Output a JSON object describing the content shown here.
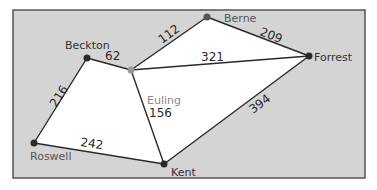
{
  "diagram": {
    "type": "weighted-graph",
    "colors": {
      "frame_fill": "#d4d4d4",
      "frame_stroke": "#555555",
      "inner_fill": "#ffffff",
      "edge": "#2a2a2a",
      "node": "#2a2a2a",
      "node_euling": "#999999",
      "label_dark": "#333333",
      "label_gray": "#8a8a8a"
    },
    "nodes": [
      {
        "id": "beckton",
        "label": "Beckton",
        "x": 87,
        "y": 58
      },
      {
        "id": "euling",
        "label": "Euling",
        "x": 131,
        "y": 70
      },
      {
        "id": "berne",
        "label": "Berne",
        "x": 207,
        "y": 17
      },
      {
        "id": "forrest",
        "label": "Forrest",
        "x": 309,
        "y": 56
      },
      {
        "id": "kent",
        "label": "Kent",
        "x": 164,
        "y": 164
      },
      {
        "id": "roswell",
        "label": "Roswell",
        "x": 34,
        "y": 143
      }
    ],
    "edges": [
      {
        "from": "beckton",
        "to": "euling",
        "weight": "62"
      },
      {
        "from": "euling",
        "to": "berne",
        "weight": "112"
      },
      {
        "from": "berne",
        "to": "forrest",
        "weight": "209"
      },
      {
        "from": "euling",
        "to": "forrest",
        "weight": "321"
      },
      {
        "from": "beckton",
        "to": "roswell",
        "weight": "216"
      },
      {
        "from": "euling",
        "to": "kent",
        "weight": "156"
      },
      {
        "from": "roswell",
        "to": "kent",
        "weight": "242"
      },
      {
        "from": "kent",
        "to": "forrest",
        "weight": "394"
      }
    ]
  }
}
